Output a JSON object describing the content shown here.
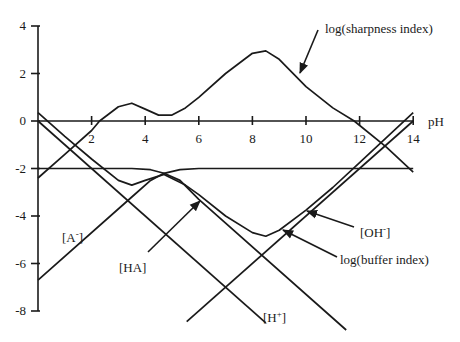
{
  "chart_data": {
    "type": "line",
    "title": "",
    "xlabel": "pH",
    "ylabel": "",
    "xlim": [
      0,
      14
    ],
    "ylim": [
      -8,
      4
    ],
    "grid": false,
    "legend": "none (direct annotations with arrows)",
    "x_ticks": [
      2,
      4,
      6,
      8,
      10,
      12,
      14
    ],
    "x_tick_labels": [
      "2",
      "4",
      "6",
      "8",
      "10",
      "12",
      "14"
    ],
    "y_ticks": [
      4,
      2,
      0,
      -2,
      -4,
      -6,
      -8
    ],
    "y_tick_labels": [
      "4",
      "2",
      "0",
      "-2",
      "-4",
      "-6",
      "-8"
    ],
    "series": [
      {
        "name": "log(sharpness index)",
        "x": [
          0,
          1,
          2,
          2.3,
          3,
          3.5,
          4,
          4.5,
          5,
          5.5,
          6,
          7,
          8,
          8.5,
          9,
          10,
          11,
          11.8,
          13,
          14
        ],
        "values": [
          -2.4,
          -1.4,
          -0.4,
          0,
          0.6,
          0.75,
          0.5,
          0.25,
          0.25,
          0.55,
          1.0,
          2.0,
          2.85,
          2.95,
          2.6,
          1.45,
          0.55,
          0,
          -1.1,
          -2.15
        ]
      },
      {
        "name": "log(buffer index)",
        "x": [
          0,
          1,
          2,
          3,
          3.5,
          4,
          4.7,
          5.5,
          6,
          7,
          8,
          8.5,
          9,
          10,
          11,
          12,
          13,
          14
        ],
        "values": [
          0.35,
          -0.65,
          -1.6,
          -2.5,
          -2.7,
          -2.5,
          -2.25,
          -2.7,
          -3.1,
          -4.0,
          -4.7,
          -4.85,
          -4.6,
          -3.75,
          -2.8,
          -1.75,
          -0.7,
          0.35
        ]
      },
      {
        "name": "[H+]",
        "x": [
          0,
          8.5
        ],
        "values": [
          0,
          -8.5
        ]
      },
      {
        "name": "[OH-]",
        "x": [
          5.55,
          14
        ],
        "values": [
          -8.45,
          0
        ]
      },
      {
        "name": "[HA]",
        "x": [
          0,
          3.5,
          4.2,
          4.7,
          5.3,
          6,
          11.5
        ],
        "values": [
          -2,
          -2,
          -2.05,
          -2.2,
          -2.5,
          -3.3,
          -8.8
        ]
      },
      {
        "name": "[A-]",
        "x": [
          0,
          3.5,
          4.2,
          4.7,
          5.3,
          6,
          7,
          14
        ],
        "values": [
          -6.7,
          -3.2,
          -2.5,
          -2.2,
          -2.05,
          -2,
          -2,
          -2
        ]
      }
    ],
    "annotations": [
      {
        "text": "log(sharpness index)",
        "arrow_to": [
          9.8,
          1.7
        ]
      },
      {
        "text": "log(buffer index)",
        "arrow_to": [
          9.2,
          -4.4
        ]
      },
      {
        "text": "[OH-]",
        "arrow_to": [
          10.8,
          -3.1
        ]
      },
      {
        "text": "[HA]",
        "arrow_to": [
          5.5,
          -2.9
        ]
      },
      {
        "text": "[A-]"
      },
      {
        "text": "[H+]"
      }
    ]
  },
  "labels": {
    "xlabel": "pH",
    "sharpness": "log(sharpness index)",
    "buffer": "log(buffer index)",
    "oh_base": "[OH",
    "oh_sup": "-",
    "oh_end": "]",
    "ha": "[HA]",
    "a_base": "[A",
    "a_sup": "-",
    "a_end": "]",
    "h_base": "[H",
    "h_sup": "+",
    "h_end": "]"
  }
}
